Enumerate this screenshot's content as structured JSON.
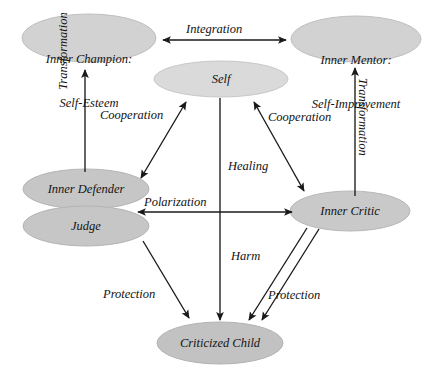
{
  "diagram": {
    "canvas": {
      "width": 434,
      "height": 375
    },
    "colors": {
      "node_fill_light": "#d9d9d9",
      "node_fill_mid": "#cfcfcf",
      "node_fill_dark": "#bcbcbc",
      "node_stroke": "#b3b3b3",
      "arrow": "#1a1a1a",
      "text": "#141414",
      "background": "#ffffff"
    },
    "nodes": [
      {
        "id": "inner-champion",
        "label": "Inner Champion:\nSelf-Esteem",
        "cx": 89,
        "cy": 38,
        "rx": 67,
        "ry": 24,
        "fill": "#d2d2d2"
      },
      {
        "id": "inner-mentor",
        "label": "Inner Mentor:\nSelf-Improvement",
        "cx": 356,
        "cy": 39,
        "rx": 65,
        "ry": 23,
        "fill": "#d2d2d2"
      },
      {
        "id": "self",
        "label": "Self",
        "cx": 221,
        "cy": 79,
        "rx": 67,
        "ry": 18,
        "fill": "#dadada"
      },
      {
        "id": "inner-defender",
        "label": "Inner Defender",
        "cx": 86,
        "cy": 189,
        "rx": 63,
        "ry": 20,
        "fill": "#c6c6c6"
      },
      {
        "id": "judge",
        "label": "Judge",
        "cx": 86,
        "cy": 226,
        "rx": 63,
        "ry": 20,
        "fill": "#c6c6c6"
      },
      {
        "id": "inner-critic",
        "label": "Inner Critic",
        "cx": 350,
        "cy": 211,
        "rx": 60,
        "ry": 20,
        "fill": "#c9c9c9"
      },
      {
        "id": "criticized-child",
        "label": "Criticized Child",
        "cx": 220,
        "cy": 343,
        "rx": 63,
        "ry": 21,
        "fill": "#c2c2c2"
      }
    ],
    "edges": [
      {
        "id": "integration",
        "label": "Integration",
        "from": "inner-champion",
        "to": "inner-mentor",
        "type": "double"
      },
      {
        "id": "transformation-left",
        "label": "Transformation",
        "from": "inner-defender",
        "to": "inner-champion",
        "type": "single",
        "orientation": "vertical-up"
      },
      {
        "id": "transformation-right",
        "label": "Transformation",
        "from": "inner-critic",
        "to": "inner-mentor",
        "type": "single",
        "orientation": "vertical-up"
      },
      {
        "id": "cooperation-left",
        "label": "Cooperation",
        "from": "inner-defender",
        "to": "self",
        "type": "double"
      },
      {
        "id": "cooperation-right",
        "label": "Cooperation",
        "from": "inner-critic",
        "to": "self",
        "type": "double"
      },
      {
        "id": "healing",
        "label": "Healing",
        "from": "self",
        "to": "criticized-child",
        "type": "single"
      },
      {
        "id": "polarization",
        "label": "Polarization",
        "from": "inner-defender",
        "to": "inner-critic",
        "type": "double"
      },
      {
        "id": "protection-left",
        "label": "Protection",
        "from": "judge",
        "to": "criticized-child",
        "type": "single"
      },
      {
        "id": "harm",
        "label": "Harm",
        "from": "inner-critic",
        "to": "criticized-child",
        "type": "single"
      },
      {
        "id": "protection-right",
        "label": "Protection",
        "from": "inner-critic",
        "to": "criticized-child",
        "type": "single"
      }
    ],
    "edge_labels": {
      "integration": "Integration",
      "transformation_left": "Transformation",
      "transformation_right": "Transformation",
      "cooperation_left": "Cooperation",
      "cooperation_right": "Cooperation",
      "healing": "Healing",
      "polarization": "Polarization",
      "protection_left": "Protection",
      "harm": "Harm",
      "protection_right": "Protection"
    },
    "node_labels": {
      "inner_champion_line1": "Inner Champion:",
      "inner_champion_line2": "Self-Esteem",
      "inner_mentor_line1": "Inner Mentor:",
      "inner_mentor_line2": "Self-Improvement",
      "self": "Self",
      "inner_defender": "Inner Defender",
      "judge": "Judge",
      "inner_critic": "Inner Critic",
      "criticized_child": "Criticized Child"
    }
  }
}
